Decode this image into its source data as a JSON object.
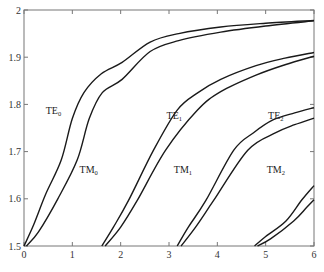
{
  "chart_data": {
    "type": "line",
    "title": "",
    "xlabel": "",
    "ylabel": "",
    "xlim": [
      0,
      6
    ],
    "ylim": [
      1.5,
      2.0
    ],
    "grid": false,
    "legend": "none (inline curve labels)",
    "x_ticks": [
      0,
      1,
      2,
      3,
      4,
      5,
      6
    ],
    "x_tick_labels": [
      "0",
      "1",
      "2",
      "3",
      "4",
      "5",
      "6"
    ],
    "y_ticks": [
      1.5,
      1.6,
      1.7,
      1.8,
      1.9,
      2.0
    ],
    "y_tick_labels": [
      "1.5",
      "1.6",
      "1.7",
      "1.8",
      "1.9",
      "2"
    ],
    "series": [
      {
        "name": "TE0",
        "label_main": "TE",
        "label_sub": "0",
        "label_at": [
          0.45,
          1.78
        ],
        "x": [
          0.0,
          0.2,
          0.45,
          0.77,
          1.0,
          1.24,
          1.6,
          2.03,
          2.61,
          3.2,
          4.07,
          5.0,
          6.0
        ],
        "y": [
          1.5,
          1.545,
          1.61,
          1.682,
          1.77,
          1.825,
          1.865,
          1.889,
          1.932,
          1.95,
          1.964,
          1.972,
          1.978
        ]
      },
      {
        "name": "TM0",
        "label_main": "TM",
        "label_sub": "0",
        "label_at": [
          1.15,
          1.655
        ],
        "x": [
          0.05,
          0.3,
          0.7,
          1.1,
          1.35,
          1.62,
          2.03,
          2.61,
          3.2,
          4.07,
          5.0,
          6.0
        ],
        "y": [
          1.5,
          1.53,
          1.6,
          1.682,
          1.77,
          1.825,
          1.853,
          1.912,
          1.935,
          1.953,
          1.966,
          1.977
        ]
      },
      {
        "name": "TE1",
        "label_main": "TE",
        "label_sub": "1",
        "label_at": [
          2.95,
          1.77
        ],
        "x": [
          1.61,
          1.85,
          2.16,
          2.68,
          3.17,
          3.6,
          4.07,
          4.8,
          5.4,
          6.0
        ],
        "y": [
          1.5,
          1.54,
          1.596,
          1.703,
          1.788,
          1.825,
          1.853,
          1.882,
          1.898,
          1.91
        ]
      },
      {
        "name": "TM1",
        "label_main": "TM",
        "label_sub": "1",
        "label_at": [
          3.1,
          1.655
        ],
        "x": [
          1.68,
          2.0,
          2.34,
          2.93,
          3.59,
          4.07,
          4.8,
          5.4,
          6.0
        ],
        "y": [
          1.5,
          1.54,
          1.596,
          1.703,
          1.788,
          1.827,
          1.862,
          1.884,
          1.902
        ]
      },
      {
        "name": "TE2",
        "label_main": "TE",
        "label_sub": "2",
        "label_at": [
          5.05,
          1.77
        ],
        "x": [
          3.17,
          3.4,
          3.76,
          4.34,
          4.75,
          5.15,
          5.6,
          6.0
        ],
        "y": [
          1.5,
          1.54,
          1.596,
          1.703,
          1.74,
          1.767,
          1.782,
          1.793
        ]
      },
      {
        "name": "TM2",
        "label_main": "TM",
        "label_sub": "2",
        "label_at": [
          5.02,
          1.655
        ],
        "x": [
          3.25,
          3.55,
          3.92,
          4.63,
          5.21,
          5.6,
          6.0
        ],
        "y": [
          1.5,
          1.54,
          1.596,
          1.703,
          1.74,
          1.757,
          1.771
        ]
      },
      {
        "name": "TE3",
        "label_main": "",
        "label_sub": "",
        "label_at": null,
        "x": [
          4.77,
          5.0,
          5.42,
          5.75,
          6.0
        ],
        "y": [
          1.5,
          1.52,
          1.553,
          1.598,
          1.628
        ]
      },
      {
        "name": "TM3",
        "label_main": "",
        "label_sub": "",
        "label_at": null,
        "x": [
          4.83,
          5.1,
          5.58,
          5.85,
          6.0
        ],
        "y": [
          1.5,
          1.515,
          1.553,
          1.582,
          1.598
        ]
      }
    ]
  }
}
